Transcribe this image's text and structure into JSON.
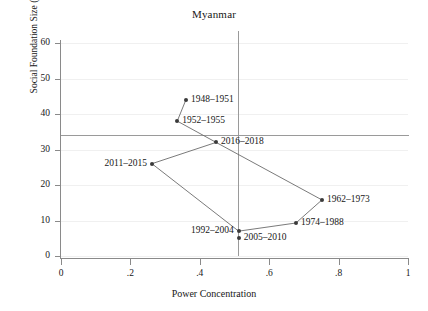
{
  "chart_data": {
    "type": "scatter",
    "title": "Myanmar",
    "xlabel": "Power Concentration",
    "ylabel": "Social Foundation Size (%)",
    "xlim": [
      0,
      1
    ],
    "ylim": [
      0,
      60
    ],
    "grid": true,
    "legend": "none",
    "connected": true,
    "xticks": [
      0,
      0.2,
      0.4,
      0.6,
      0.8,
      1
    ],
    "xtick_labels": [
      "0",
      ".2",
      ".4",
      ".6",
      ".8",
      "1"
    ],
    "yticks": [
      0,
      10,
      20,
      30,
      40,
      50,
      60
    ],
    "ytick_labels": [
      "0",
      "10",
      "20",
      "30",
      "40",
      "50",
      "60"
    ],
    "reference_lines": {
      "horizontal": 34,
      "vertical": 0.51
    },
    "points": [
      {
        "label": "1948–1951",
        "x": 0.36,
        "y": 44,
        "label_side": "right"
      },
      {
        "label": "1952–1955",
        "x": 0.335,
        "y": 38,
        "label_side": "right"
      },
      {
        "label": "1962–1973",
        "x": 0.752,
        "y": 15.8,
        "label_side": "right"
      },
      {
        "label": "1974–1988",
        "x": 0.677,
        "y": 9.3,
        "label_side": "right"
      },
      {
        "label": "1992–2004",
        "x": 0.512,
        "y": 7,
        "label_side": "left"
      },
      {
        "label": "2005–2010",
        "x": 0.512,
        "y": 5,
        "label_side": "right"
      },
      {
        "label": "2011–2015",
        "x": 0.262,
        "y": 26,
        "label_side": "left"
      },
      {
        "label": "2016–2018",
        "x": 0.447,
        "y": 32,
        "label_side": "right"
      }
    ],
    "path_order": [
      "1948–1951",
      "1952–1955",
      "2016–2018",
      "1962–1973",
      "1974–1988",
      "1992–2004",
      "2011–2015",
      "2016–2018"
    ],
    "colors": {
      "marker": "#3a3a3a",
      "line": "#6b6b6b",
      "axis": "#8a8a8a",
      "grid": "#f0f0f0",
      "reference": "#9a9a9a",
      "text": "#171717",
      "background": "#ffffff"
    }
  }
}
